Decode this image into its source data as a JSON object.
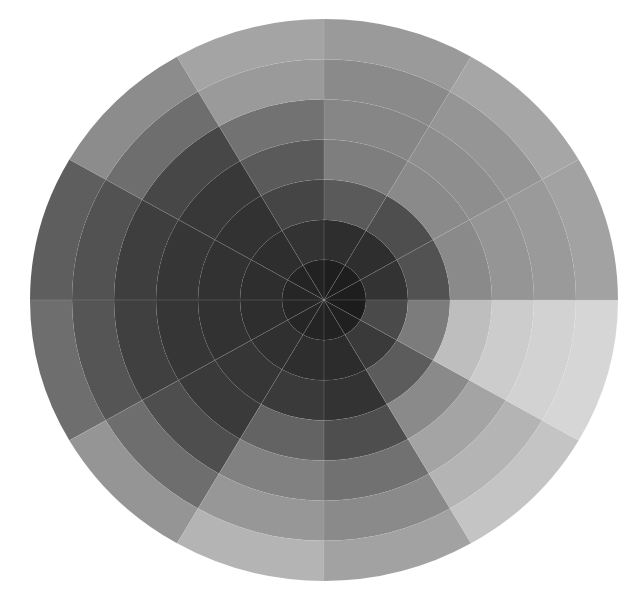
{
  "artwork": {
    "subject": "painted grayscale segmented wheel",
    "wedge_count": 12,
    "ring_count": 7,
    "wedge_order": "counterclockwise from 3 o'clock, 30 degrees each",
    "ring_order": "inner to outer",
    "background": "#ffffff",
    "wedges": [
      {
        "start_deg": 0,
        "end_deg": 30,
        "rings": [
          "#1e1e1e",
          "#333333",
          "#525252",
          "#8a8a8a",
          "#959595",
          "#9a9a9a",
          "#a2a2a2"
        ]
      },
      {
        "start_deg": 30,
        "end_deg": 60,
        "rings": [
          "#1e1e1e",
          "#2e2e2e",
          "#4e4e4e",
          "#8a8a8a",
          "#8e8e8e",
          "#959595",
          "#a6a6a6"
        ]
      },
      {
        "start_deg": 60,
        "end_deg": 90,
        "rings": [
          "#1e1e1e",
          "#2e2e2e",
          "#5a5a5a",
          "#7e7e7e",
          "#868686",
          "#8a8a8a",
          "#9a9a9a"
        ]
      },
      {
        "start_deg": 90,
        "end_deg": 120,
        "rings": [
          "#222222",
          "#333333",
          "#454545",
          "#5a5a5a",
          "#727272",
          "#9a9a9a",
          "#a4a4a4"
        ]
      },
      {
        "start_deg": 120,
        "end_deg": 150,
        "rings": [
          "#242424",
          "#2e2e2e",
          "#323232",
          "#383838",
          "#474747",
          "#6e6e6e",
          "#8c8c8c"
        ]
      },
      {
        "start_deg": 150,
        "end_deg": 180,
        "rings": [
          "#262626",
          "#2e2e2e",
          "#323232",
          "#363636",
          "#3e3e3e",
          "#525252",
          "#5e5e5e"
        ]
      },
      {
        "start_deg": 180,
        "end_deg": 210,
        "rings": [
          "#262626",
          "#2e2e2e",
          "#323232",
          "#363636",
          "#404040",
          "#555555",
          "#6e6e6e"
        ]
      },
      {
        "start_deg": 210,
        "end_deg": 240,
        "rings": [
          "#262626",
          "#303030",
          "#363636",
          "#3a3a3a",
          "#4e4e4e",
          "#6e6e6e",
          "#959595"
        ]
      },
      {
        "start_deg": 240,
        "end_deg": 270,
        "rings": [
          "#242424",
          "#2e2e2e",
          "#3a3a3a",
          "#636363",
          "#818181",
          "#979797",
          "#b4b4b4"
        ]
      },
      {
        "start_deg": 270,
        "end_deg": 300,
        "rings": [
          "#222222",
          "#2c2c2c",
          "#333333",
          "#4e4e4e",
          "#717171",
          "#8a8a8a",
          "#a2a2a2"
        ]
      },
      {
        "start_deg": 300,
        "end_deg": 330,
        "rings": [
          "#202020",
          "#3a3a3a",
          "#5c5c5c",
          "#8a8a8a",
          "#a4a4a4",
          "#b4b4b4",
          "#c4c4c4"
        ]
      },
      {
        "start_deg": 330,
        "end_deg": 360,
        "rings": [
          "#1c1c1c",
          "#4a4a4a",
          "#7c7c7c",
          "#bebebe",
          "#cccccc",
          "#d2d2d2",
          "#d6d6d6"
        ]
      }
    ]
  }
}
